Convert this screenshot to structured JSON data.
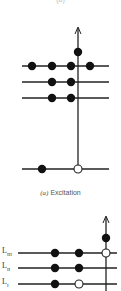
{
  "figure": {
    "top_cut_label": "(b)",
    "panel_a": {
      "caption_prefix": "(a)",
      "caption_text": "Excitation",
      "levels": [
        {
          "y": 66,
          "filled": [
            32,
            52,
            71,
            90
          ],
          "open": []
        },
        {
          "y": 82,
          "filled": [
            52,
            71
          ],
          "open": []
        },
        {
          "y": 98,
          "filled": [
            52,
            71
          ],
          "open": []
        },
        {
          "y": 169,
          "filled": [
            42
          ],
          "open": [
            78
          ]
        }
      ],
      "excited_electron": {
        "x": 78,
        "y": 52
      },
      "arrow_x": 78
    },
    "panel_b": {
      "labels": [
        {
          "text": "L",
          "sub": "III"
        },
        {
          "text": "L",
          "sub": "II"
        },
        {
          "text": "L",
          "sub": "I"
        }
      ],
      "levels": [
        {
          "y": 253,
          "filled": [
            55,
            79
          ],
          "open": [
            106
          ]
        },
        {
          "y": 268,
          "filled": [
            55,
            79
          ],
          "open": []
        },
        {
          "y": 284,
          "filled": [
            55
          ],
          "open": [
            79
          ]
        }
      ],
      "excited_electron": {
        "x": 106,
        "y": 238
      },
      "arrow_x": 106
    },
    "colors": {
      "line": "#222222",
      "filled": "#111111",
      "open_fill": "#ffffff"
    }
  }
}
